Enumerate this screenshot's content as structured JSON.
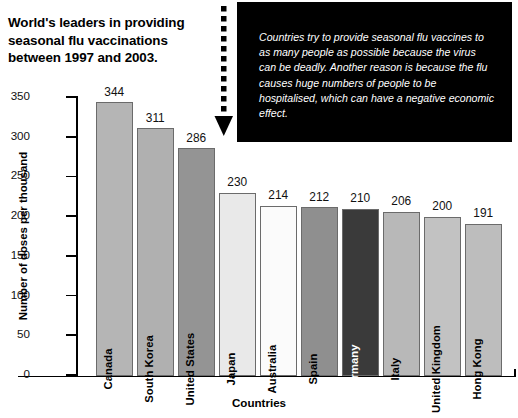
{
  "title": "World's leaders in providing seasonal flu vaccinations between 1997 and 2003.",
  "callout": {
    "text": "Countries try to provide seasonal flu vaccines to as many people as possible because the virus can be deadly. Another reason is because the flu causes huge numbers of people to be hospitalised, which can have a negative economic effect.",
    "background": "#000000",
    "text_color": "#ffffff"
  },
  "annotation": {
    "arrow_icon": "dotted-down-arrow",
    "arrow_color": "#000000"
  },
  "chart_data": {
    "type": "bar",
    "title": "World's leaders in providing seasonal flu vaccinations between 1997 and 2003.",
    "xlabel": "Countries",
    "ylabel": "Number of doses per thousand",
    "ylim": [
      0,
      350
    ],
    "yticks": [
      0,
      50,
      100,
      150,
      200,
      250,
      300,
      350
    ],
    "ytick_labels": [
      "0",
      "50",
      "100",
      "150",
      "200",
      "250",
      "300",
      "350"
    ],
    "grid": false,
    "legend": null,
    "categories": [
      "Canada",
      "South Korea",
      "United States",
      "Japan",
      "Australia",
      "Spain",
      "Germany",
      "Italy",
      "United Kingdom",
      "Hong Kong"
    ],
    "values": [
      344,
      311,
      286,
      230,
      214,
      212,
      210,
      206,
      200,
      191
    ],
    "bar_colors": [
      "#b5b5b5",
      "#b0b0b0",
      "#949494",
      "#e9e9e9",
      "#fbfbfb",
      "#8f8f8f",
      "#3a3a3a",
      "#b8b8b8",
      "#c2c2c2",
      "#bdbdbd"
    ],
    "bar_label_colors": [
      "#000000",
      "#000000",
      "#000000",
      "#000000",
      "#000000",
      "#000000",
      "#ffffff",
      "#000000",
      "#000000",
      "#000000"
    ],
    "bar_edge_color": "#6b6b6b"
  }
}
